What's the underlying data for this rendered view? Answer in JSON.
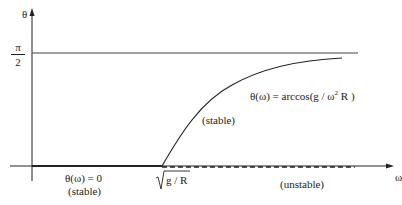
{
  "axes": {
    "y_label": "θ",
    "x_label": "ω",
    "y_tick": {
      "numerator": "π",
      "denominator": "2"
    }
  },
  "annotations": {
    "curve_formula_prefix": "θ(ω) =  arccos(g / ω",
    "curve_formula_exp": "2",
    "curve_formula_suffix": " R )",
    "curve_stability": "(stable)",
    "zero_formula": "θ(ω) = 0",
    "zero_stability": "(stable)",
    "critical_value": "g / R",
    "unstable_label": "(unstable)"
  },
  "colors": {
    "line": "#222222",
    "asymptote": "#444444"
  }
}
